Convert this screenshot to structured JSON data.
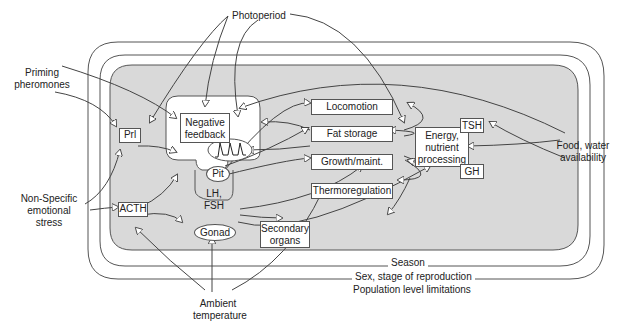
{
  "diagram": {
    "external_factors": {
      "photoperiod": "Photoperiod",
      "priming_pheromones": [
        "Priming",
        "pheromones"
      ],
      "nonspecific_stress": [
        "Non-Specific",
        "emotional",
        "stress"
      ],
      "ambient_temperature": [
        "Ambient",
        "temperature"
      ],
      "food_water": [
        "Food, water",
        "availability"
      ]
    },
    "nested_bands": {
      "season": "Season",
      "sex_stage": "Sex, stage of reproduction",
      "population": "Population level limitations"
    },
    "nodes": {
      "prl": "Prl",
      "acth": "ACTH",
      "negative_feedback": [
        "Negative",
        "feedback"
      ],
      "pit": "Pit",
      "lh_fsh": [
        "LH,",
        "FSH"
      ],
      "gonad": "Gonad",
      "secondary_organs": [
        "Secondary",
        "organs"
      ],
      "locomotion": "Locomotion",
      "fat_storage": "Fat storage",
      "growth_maint": "Growth/maint.",
      "thermoregulation": "Thermoregulation",
      "energy": [
        "Energy,",
        "nutrient",
        "processing"
      ],
      "tsh": "TSH",
      "gh": "GH"
    },
    "colors": {
      "inner_fill": "#d9d9d9",
      "stroke": "#555555",
      "arrow_fill": "#ffffff"
    }
  }
}
